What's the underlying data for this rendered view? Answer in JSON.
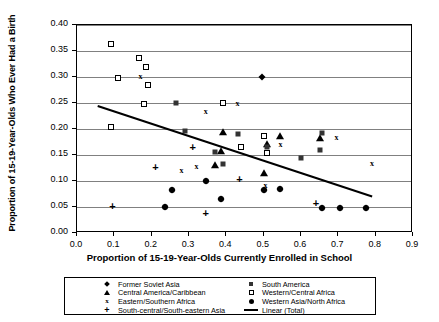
{
  "chart_data": {
    "type": "scatter",
    "title": "",
    "xlabel": "Proportion of 15-19-Year-Olds Currently Enrolled in School",
    "ylabel": "Proportion of 15-19-Year-Olds Who Ever Had a Birth",
    "xlim": [
      0.0,
      0.9
    ],
    "ylim": [
      0.0,
      0.4
    ],
    "xticks": [
      "0.0",
      "0.1",
      "0.2",
      "0.3",
      "0.4",
      "0.5",
      "0.6",
      "0.7",
      "0.8",
      "0.9"
    ],
    "xtick_values": [
      0.0,
      0.1,
      0.2,
      0.3,
      0.4,
      0.5,
      0.6,
      0.7,
      0.8,
      0.9
    ],
    "yticks": [
      "0.00",
      "0.05",
      "0.10",
      "0.15",
      "0.20",
      "0.25",
      "0.30",
      "0.35",
      "0.40"
    ],
    "ytick_values": [
      0.0,
      0.05,
      0.1,
      0.15,
      0.2,
      0.25,
      0.3,
      0.35,
      0.4
    ],
    "grid": true,
    "grid_axis": "y",
    "legend_position": "bottom",
    "series": [
      {
        "name": "Former Soviet Asia",
        "marker": "diamond-filled",
        "points": [
          [
            0.235,
            0.05
          ],
          [
            0.255,
            0.083
          ],
          [
            0.345,
            0.1
          ],
          [
            0.385,
            0.066
          ],
          [
            0.5,
            0.083
          ],
          [
            0.545,
            0.085
          ],
          [
            0.655,
            0.049
          ],
          [
            0.705,
            0.048
          ],
          [
            0.775,
            0.048
          ],
          [
            0.495,
            0.3
          ]
        ]
      },
      {
        "name": "Central America/Caribbean",
        "marker": "triangle-filled",
        "points": [
          [
            0.37,
            0.131
          ],
          [
            0.385,
            0.158
          ],
          [
            0.5,
            0.115
          ],
          [
            0.51,
            0.171
          ],
          [
            0.545,
            0.186
          ],
          [
            0.65,
            0.182
          ],
          [
            0.39,
            0.195
          ]
        ]
      },
      {
        "name": "Eastern/Southern Africa",
        "marker": "x",
        "points": [
          [
            0.28,
            0.12
          ],
          [
            0.345,
            0.232
          ],
          [
            0.32,
            0.127
          ],
          [
            0.43,
            0.248
          ],
          [
            0.505,
            0.09
          ],
          [
            0.545,
            0.17
          ],
          [
            0.695,
            0.182
          ],
          [
            0.79,
            0.133
          ],
          [
            0.17,
            0.3
          ]
        ]
      },
      {
        "name": "South-central/South-eastern Asia",
        "marker": "plus",
        "points": [
          [
            0.095,
            0.05
          ],
          [
            0.21,
            0.125
          ],
          [
            0.31,
            0.164
          ],
          [
            0.345,
            0.037
          ],
          [
            0.435,
            0.101
          ],
          [
            0.64,
            0.055
          ]
        ]
      },
      {
        "name": "South America",
        "marker": "square-filled",
        "points": [
          [
            0.29,
            0.196
          ],
          [
            0.37,
            0.155
          ],
          [
            0.43,
            0.19
          ],
          [
            0.39,
            0.133
          ],
          [
            0.51,
            0.166
          ],
          [
            0.6,
            0.145
          ],
          [
            0.65,
            0.16
          ],
          [
            0.655,
            0.192
          ],
          [
            0.265,
            0.25
          ]
        ]
      },
      {
        "name": "Western/Central Africa",
        "marker": "square-open",
        "points": [
          [
            0.09,
            0.363
          ],
          [
            0.11,
            0.299
          ],
          [
            0.165,
            0.336
          ],
          [
            0.185,
            0.32
          ],
          [
            0.19,
            0.285
          ],
          [
            0.09,
            0.203
          ],
          [
            0.18,
            0.248
          ],
          [
            0.39,
            0.25
          ],
          [
            0.5,
            0.186
          ],
          [
            0.508,
            0.153
          ],
          [
            0.44,
            0.165
          ]
        ]
      },
      {
        "name": "Western Asia/North Africa",
        "marker": "circle-filled",
        "points": [
          [
            0.235,
            0.05
          ],
          [
            0.255,
            0.083
          ],
          [
            0.345,
            0.1
          ],
          [
            0.385,
            0.066
          ],
          [
            0.5,
            0.083
          ],
          [
            0.545,
            0.085
          ],
          [
            0.655,
            0.049
          ],
          [
            0.705,
            0.048
          ],
          [
            0.775,
            0.048
          ]
        ]
      }
    ],
    "trendline": {
      "name": "Linear (Total)",
      "x_start": 0.055,
      "y_start": 0.247,
      "x_end": 0.79,
      "y_end": 0.073
    }
  },
  "legend": {
    "columns": [
      [
        {
          "marker": "diamond-filled",
          "label": "Former Soviet Asia"
        },
        {
          "marker": "triangle-filled",
          "label": "Central America/Caribbean"
        },
        {
          "marker": "x",
          "label": "Eastern/Southern Africa"
        },
        {
          "marker": "plus",
          "label": "South-central/South-eastern Asia"
        }
      ],
      [
        {
          "marker": "square-filled",
          "label": "South America"
        },
        {
          "marker": "square-open",
          "label": "Western/Central Africa"
        },
        {
          "marker": "circle-filled",
          "label": "Western Asia/North Africa"
        },
        {
          "marker": "line",
          "label": "Linear (Total)"
        }
      ]
    ]
  }
}
